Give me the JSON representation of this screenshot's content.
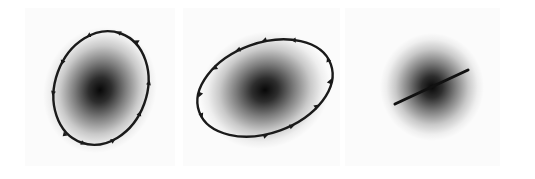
{
  "figure": {
    "background": "#ffffff",
    "panel_background": "#fbfbfb",
    "stroke_color": "#1a1a1a",
    "panels": [
      {
        "name": "elliptical-polarization-vertical",
        "trace": "ellipse",
        "rotation_direction": "counterclockwise",
        "center": [
          101,
          88
        ],
        "rx": 46,
        "ry": 58,
        "tilt_deg": 20,
        "spot_center": [
          100,
          90
        ],
        "spot_rx": 52,
        "spot_ry": 60
      },
      {
        "name": "elliptical-polarization-horizontal",
        "trace": "ellipse",
        "rotation_direction": "counterclockwise",
        "center": [
          265,
          88
        ],
        "rx": 70,
        "ry": 45,
        "tilt_deg": -20,
        "spot_center": [
          265,
          90
        ],
        "spot_rx": 62,
        "spot_ry": 55
      },
      {
        "name": "linear-polarization",
        "trace": "line",
        "start": [
          395,
          104
        ],
        "end": [
          468,
          70
        ],
        "spot_center": [
          432,
          87
        ],
        "spot_rx": 50,
        "spot_ry": 50
      }
    ]
  }
}
